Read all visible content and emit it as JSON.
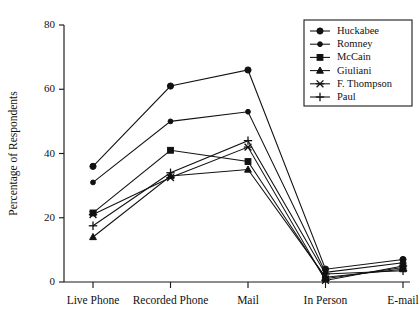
{
  "chart_data": {
    "type": "line",
    "title": "",
    "xlabel": "",
    "ylabel": "Percentage of Respondents",
    "categories": [
      "Live Phone",
      "Recorded Phone",
      "Mail",
      "In Person",
      "E-mail"
    ],
    "ylim": [
      0,
      80
    ],
    "yticks": [
      0,
      20,
      40,
      60,
      80
    ],
    "grid": false,
    "legend_position": "top-right",
    "series": [
      {
        "name": "Huckabee",
        "marker": "circle",
        "values": [
          36,
          61,
          66,
          4,
          7
        ]
      },
      {
        "name": "Romney",
        "marker": "small-circle",
        "values": [
          31,
          50,
          53,
          3,
          6
        ]
      },
      {
        "name": "McCain",
        "marker": "square",
        "values": [
          21.5,
          41,
          37.5,
          1,
          4.5
        ]
      },
      {
        "name": "Giuliani",
        "marker": "triangle",
        "values": [
          14,
          33,
          35,
          1.5,
          4
        ]
      },
      {
        "name": "F. Thompson",
        "marker": "x",
        "values": [
          21,
          32.5,
          42,
          0.5,
          5
        ]
      },
      {
        "name": "Paul",
        "marker": "plus",
        "values": [
          17.5,
          34,
          44,
          2.5,
          3.5
        ]
      }
    ]
  },
  "colors": {
    "ink": "#111111",
    "axis": "#1a1a1a",
    "background": "#ffffff"
  },
  "legend": {
    "entries": [
      "Huckabee",
      "Romney",
      "McCain",
      "Giuliani",
      "F. Thompson",
      "Paul"
    ]
  }
}
